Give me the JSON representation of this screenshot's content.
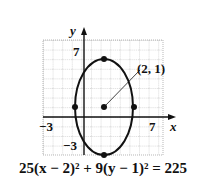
{
  "figure": {
    "type": "ellipse-graph",
    "axes": {
      "x_label": "x",
      "y_label": "y",
      "x_ticks_labeled": [
        "-3",
        "7"
      ],
      "y_ticks_labeled": [
        "7",
        "-3"
      ],
      "grid": true,
      "x_range": [
        -3,
        9
      ],
      "y_range": [
        -4,
        8
      ]
    },
    "ellipse": {
      "center": [
        2,
        1
      ],
      "center_label": "(2, 1)",
      "semi_major_vertical": 5,
      "semi_minor_horizontal": 3,
      "marked_points": [
        [
          2,
          6
        ],
        [
          2,
          -4
        ],
        [
          -1,
          1
        ],
        [
          5,
          1
        ],
        [
          2,
          1
        ]
      ]
    },
    "equation": "25(x − 2)² + 9(y − 1)² = 225",
    "colors": {
      "curve": "#111111",
      "grid": "#888888",
      "background": "#ffffff"
    }
  }
}
